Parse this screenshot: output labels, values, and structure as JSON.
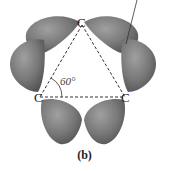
{
  "diagram": {
    "type": "molecular-orbital-illustration",
    "atoms": [
      {
        "label": "C",
        "position": "top"
      },
      {
        "label": "C",
        "position": "bottom-left"
      },
      {
        "label": "C",
        "position": "bottom-right"
      }
    ],
    "angle_label": "60°",
    "caption": "(b)",
    "colors": {
      "lobe": "#7a7a7a",
      "lobe_dark": "#5a5a5a",
      "lobe_light": "#9a9a9a",
      "bond_line": "#333333"
    }
  }
}
